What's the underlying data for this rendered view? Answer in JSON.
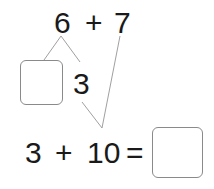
{
  "problem": {
    "top_expression": {
      "left": "6",
      "operator": "+",
      "right": "7"
    },
    "decomposition": {
      "blank_part": "",
      "given_part": "3"
    },
    "bottom_expression": {
      "left": "3",
      "operator": "+",
      "right": "10",
      "equals": "=",
      "answer": ""
    }
  },
  "colors": {
    "text": "#1a1a1a",
    "lines": "#9a9a9a",
    "box_border": "#8a8a8a"
  }
}
